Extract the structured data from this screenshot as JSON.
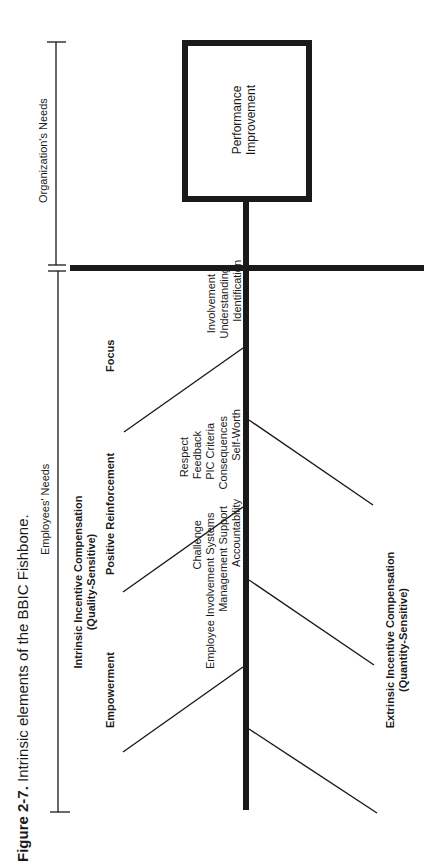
{
  "caption": {
    "label": "Figure 2-7.",
    "title": "Intrinsic elements of the BBIC Fishbone."
  },
  "brackets": {
    "organization": "Organization's Needs",
    "employees": "Employees' Needs"
  },
  "head_box": {
    "line1": "Performance",
    "line2": "Improvement"
  },
  "intrinsic": {
    "title": "Intrinsic Incentive Compensation",
    "subtitle": "(Quality-Sensitive)",
    "bones": [
      {
        "label": "Focus",
        "items": [
          "Involvement",
          "Understanding",
          "Identification"
        ]
      },
      {
        "label": "Positive Reinforcement",
        "items": [
          "Respect",
          "Feedback",
          "PIC Criteria",
          "Consequences",
          "Self-Worth"
        ]
      },
      {
        "label": "Empowerment",
        "items": [
          "Challenge",
          "Employee Involvement Systems",
          "Management Support",
          "Accountability"
        ]
      }
    ]
  },
  "extrinsic": {
    "title": "Extrinsic Incentive Compensation",
    "subtitle": "(Quantity-Sensitive)"
  },
  "colors": {
    "line": "#1a1a1a",
    "background": "#ffffff"
  }
}
